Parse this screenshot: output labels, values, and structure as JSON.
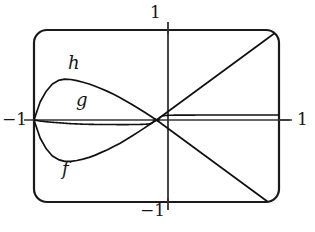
{
  "figure": {
    "title": "",
    "frame": {
      "stroke_color": "#1a1a1a",
      "fill_color": "#ffffff",
      "corner_radius": 12
    },
    "axis_color": "#2b2b2b",
    "curve_color": "#111111"
  },
  "axis_labels": {
    "top": "1",
    "bottom": "−1",
    "left": "−1",
    "right": "1"
  },
  "curve_labels": {
    "f": "f",
    "g": "g",
    "h": "h"
  },
  "chart_data": {
    "type": "line",
    "title": "",
    "xlabel": "",
    "ylabel": "",
    "xlim": [
      -1,
      1
    ],
    "ylim": [
      -1,
      1
    ],
    "xticks": [
      -1,
      1
    ],
    "xticklabels": [
      "−1",
      "1"
    ],
    "yticks": [
      -1,
      1
    ],
    "yticklabels": [
      "−1",
      "1"
    ],
    "grid": false,
    "legend": "inline-annotations",
    "annotations": [
      {
        "text": "h",
        "x": -0.62,
        "y": 0.66,
        "describes": "upper envelope curve"
      },
      {
        "text": "g",
        "x": -0.55,
        "y": 0.31,
        "describes": "oscillating curve between envelopes"
      },
      {
        "text": "f",
        "x": -0.68,
        "y": -0.37,
        "describes": "lower envelope curve"
      }
    ],
    "series": [
      {
        "name": "h",
        "role": "upper-envelope",
        "description": "Upper bounding curve: starts at (-1,0), rises to a maximum near (-0.66,0.44) then decreases to 0 at x=0, then rises linearly toward (1,1).",
        "x": [
          -1.0,
          -0.95,
          -0.9,
          -0.85,
          -0.8,
          -0.75,
          -0.7,
          -0.65,
          -0.6,
          -0.55,
          -0.5,
          -0.45,
          -0.4,
          -0.35,
          -0.3,
          -0.25,
          -0.2,
          -0.15,
          -0.1,
          -0.05,
          0.0,
          0.1,
          0.2,
          0.3,
          0.4,
          0.5,
          0.6,
          0.7,
          0.8,
          0.9,
          1.0
        ],
        "y": [
          0.0,
          0.2,
          0.32,
          0.4,
          0.44,
          0.455,
          0.45,
          0.438,
          0.42,
          0.4,
          0.375,
          0.348,
          0.318,
          0.285,
          0.25,
          0.212,
          0.172,
          0.13,
          0.088,
          0.044,
          0.0,
          0.1,
          0.2,
          0.3,
          0.4,
          0.5,
          0.6,
          0.7,
          0.8,
          0.9,
          1.0
        ]
      },
      {
        "name": "f",
        "role": "lower-envelope",
        "description": "Lower bounding curve: mirror-like lobe below axis on the left, minimum near (-0.55,-0.45), returning to 0 at x=0, then descending linearly to (1,-1) region.",
        "x": [
          -1.0,
          -0.95,
          -0.9,
          -0.85,
          -0.8,
          -0.75,
          -0.7,
          -0.65,
          -0.6,
          -0.55,
          -0.5,
          -0.45,
          -0.4,
          -0.35,
          -0.3,
          -0.25,
          -0.2,
          -0.15,
          -0.1,
          -0.05,
          0.0,
          0.1,
          0.2,
          0.3,
          0.4,
          0.5,
          0.6,
          0.7,
          0.8,
          0.9,
          1.0
        ],
        "y": [
          0.0,
          -0.2,
          -0.32,
          -0.4,
          -0.44,
          -0.46,
          -0.46,
          -0.45,
          -0.435,
          -0.415,
          -0.39,
          -0.36,
          -0.33,
          -0.295,
          -0.26,
          -0.22,
          -0.178,
          -0.135,
          -0.09,
          -0.045,
          0.0,
          -0.1,
          -0.2,
          -0.3,
          -0.4,
          -0.5,
          -0.6,
          -0.7,
          -0.8,
          -0.9,
          -1.0
        ]
      },
      {
        "name": "g",
        "role": "oscillating",
        "description": "Rapidly oscillating curve of the form x·sin(1/x)-type, squeezed between f and h, with oscillation frequency increasing without bound as x approaches 0 and amplitude shrinking to 0 at the origin.",
        "oscillation_model": "envelope(x) * sin(k/x)",
        "zeros_accumulate_at": 0,
        "amplitude_at_origin": 0,
        "max_amplitude_left": 0.46,
        "max_amplitude_right": 1.0
      }
    ]
  }
}
